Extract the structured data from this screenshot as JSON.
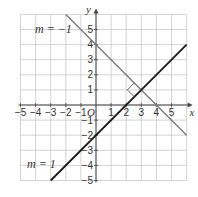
{
  "chart_data": {
    "type": "line",
    "title": "",
    "xlabel": "x",
    "ylabel": "y",
    "origin_label": "O",
    "xlim": [
      -5,
      6
    ],
    "ylim": [
      -5,
      6
    ],
    "grid": true,
    "x_ticks": [
      -5,
      -4,
      -3,
      -2,
      -1,
      1,
      2,
      3,
      4,
      5
    ],
    "y_ticks": [
      -5,
      -4,
      -3,
      -2,
      -1,
      1,
      2,
      3,
      4,
      5
    ],
    "series": [
      {
        "name": "m = −1",
        "label": "m = −1",
        "equation": "y = −x + 4",
        "slope": -1,
        "intercept": 4,
        "points": [
          [
            -2,
            6
          ],
          [
            6,
            -2
          ]
        ],
        "color": "#7a7a7a"
      },
      {
        "name": "m = 1",
        "label": "m = 1",
        "equation": "y = x − 2",
        "slope": 1,
        "intercept": -2,
        "points": [
          [
            -3,
            -5
          ],
          [
            6,
            4
          ]
        ],
        "color": "#1a1a1a"
      }
    ],
    "annotations": [
      {
        "type": "right-angle",
        "at": [
          3,
          1
        ],
        "text": ""
      }
    ],
    "intersection": [
      3,
      1
    ]
  },
  "labels": {
    "m_neg": "m = −1",
    "m_pos": "m = 1",
    "x_axis": "x",
    "y_axis": "y",
    "origin": "O"
  }
}
